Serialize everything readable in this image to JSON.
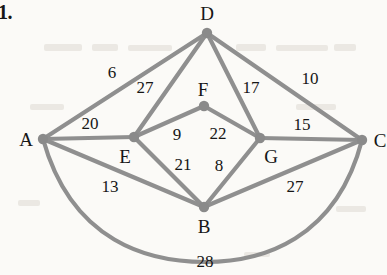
{
  "figure": {
    "problem_number": "1.",
    "caption": "",
    "edge_color": "#8f8f8f",
    "node_color": "#8a8a8a",
    "label_color": "#161616",
    "background_color": "#fbfaf7",
    "edge_width": 4.2,
    "node_radius": 5.2
  },
  "nodes": [
    {
      "id": "A",
      "label": "A",
      "x": 43,
      "y": 139,
      "label_x": 26,
      "label_y": 139
    },
    {
      "id": "B",
      "label": "B",
      "x": 204,
      "y": 207,
      "label_x": 204,
      "label_y": 226
    },
    {
      "id": "C",
      "label": "C",
      "x": 362,
      "y": 140,
      "label_x": 380,
      "label_y": 140
    },
    {
      "id": "D",
      "label": "D",
      "x": 207,
      "y": 33,
      "label_x": 207,
      "label_y": 13
    },
    {
      "id": "E",
      "label": "E",
      "x": 134,
      "y": 137,
      "label_x": 125,
      "label_y": 156
    },
    {
      "id": "F",
      "label": "F",
      "x": 204,
      "y": 106,
      "label_x": 203,
      "label_y": 89
    },
    {
      "id": "G",
      "label": "G",
      "x": 260,
      "y": 138,
      "label_x": 271,
      "label_y": 156
    }
  ],
  "edges": [
    {
      "from": "A",
      "to": "D",
      "weight": "6",
      "label_x": 112,
      "label_y": 72,
      "curved": false
    },
    {
      "from": "A",
      "to": "E",
      "weight": "20",
      "label_x": 90,
      "label_y": 123,
      "curved": false
    },
    {
      "from": "A",
      "to": "B",
      "weight": "13",
      "label_x": 110,
      "label_y": 186,
      "curved": false
    },
    {
      "from": "A",
      "to": "C",
      "weight": "28",
      "label_x": 205,
      "label_y": 261,
      "curved": true,
      "path": "M 43 139 C 72 243, 150 262, 205 262 C 262 262, 336 240, 362 140"
    },
    {
      "from": "E",
      "to": "D",
      "weight": "27",
      "label_x": 145,
      "label_y": 87,
      "curved": false
    },
    {
      "from": "D",
      "to": "G",
      "weight": "17",
      "label_x": 251,
      "label_y": 87,
      "curved": false
    },
    {
      "from": "D",
      "to": "C",
      "weight": "10",
      "label_x": 310,
      "label_y": 78,
      "curved": false
    },
    {
      "from": "E",
      "to": "F",
      "weight": "9",
      "label_x": 177,
      "label_y": 134,
      "curved": false
    },
    {
      "from": "F",
      "to": "G",
      "weight": "22",
      "label_x": 218,
      "label_y": 133,
      "curved": false
    },
    {
      "from": "E",
      "to": "B",
      "weight": "21",
      "label_x": 183,
      "label_y": 164,
      "curved": false
    },
    {
      "from": "B",
      "to": "G",
      "weight": "8",
      "label_x": 219,
      "label_y": 165,
      "curved": false
    },
    {
      "from": "G",
      "to": "C",
      "weight": "15",
      "label_x": 302,
      "label_y": 124,
      "curved": false
    },
    {
      "from": "B",
      "to": "C",
      "weight": "27",
      "label_x": 295,
      "label_y": 186,
      "curved": false
    }
  ],
  "graph_data": {
    "type": "weighted-undirected-graph",
    "node_count": 7,
    "edge_count": 13,
    "adjacency": [
      [
        "A",
        "D",
        6
      ],
      [
        "A",
        "E",
        20
      ],
      [
        "A",
        "B",
        13
      ],
      [
        "A",
        "C",
        28
      ],
      [
        "E",
        "D",
        27
      ],
      [
        "D",
        "G",
        17
      ],
      [
        "D",
        "C",
        10
      ],
      [
        "E",
        "F",
        9
      ],
      [
        "F",
        "G",
        22
      ],
      [
        "E",
        "B",
        21
      ],
      [
        "B",
        "G",
        8
      ],
      [
        "G",
        "C",
        15
      ],
      [
        "B",
        "C",
        27
      ]
    ]
  }
}
